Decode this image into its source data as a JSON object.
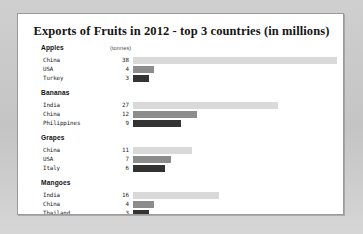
{
  "chart_data": {
    "type": "bar",
    "title": "Exports of Fruits in 2012 - top 3 countries (in millions)",
    "xlabel": "",
    "ylabel": "",
    "unit_label": "(tonnes)",
    "orientation": "horizontal",
    "grid": false,
    "legend": "none",
    "xlim": [
      0,
      38
    ],
    "series_shades": [
      "#d9d9d9",
      "#8c8c8c",
      "#333333"
    ],
    "groups": [
      {
        "name": "Apples",
        "categories": [
          "China",
          "USA",
          "Turkey"
        ],
        "values": [
          38,
          4,
          3
        ]
      },
      {
        "name": "Bananas",
        "categories": [
          "India",
          "China",
          "Philippines"
        ],
        "values": [
          27,
          12,
          9
        ]
      },
      {
        "name": "Grapes",
        "categories": [
          "China",
          "USA",
          "Italy"
        ],
        "values": [
          11,
          7,
          6
        ]
      },
      {
        "name": "Mangoes",
        "categories": [
          "India",
          "China",
          "Thailand"
        ],
        "values": [
          16,
          4,
          3
        ]
      }
    ]
  }
}
